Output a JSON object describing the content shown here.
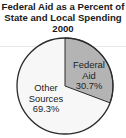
{
  "title": {
    "line1": "Federal Aid as a Percent of",
    "line2": "State and Local Spending",
    "line3": "2000"
  },
  "colors": {
    "federal_aid": "#b4b4b4",
    "other_sources": "#f7f7f7",
    "outline": "#2a2a2a"
  },
  "slices": [
    {
      "label_line1": "Federal",
      "label_line2": "Aid",
      "value_label": "30.7%"
    },
    {
      "label_line1": "Other",
      "label_line2": "Sources",
      "value_label": "69.3%"
    }
  ],
  "chart_data": {
    "type": "pie",
    "title": "Federal Aid as a Percent of State and Local Spending 2000",
    "categories": [
      "Federal Aid",
      "Other Sources"
    ],
    "values": [
      30.7,
      69.3
    ],
    "units": "%",
    "legend": "none (labels inside slices)"
  }
}
